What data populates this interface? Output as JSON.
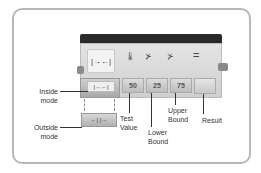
{
  "block": {
    "mode_icon": "|→←|",
    "icons": [
      "thermometer-icon",
      "lower-bound-icon",
      "upper-bound-icon",
      "equals-icon"
    ],
    "equals_symbol": "=",
    "inside_mode_glyph": "|→←|",
    "outside_mode_glyph": "←|   |→",
    "values": {
      "test_value": "50",
      "lower_bound": "25",
      "upper_bound": "75"
    }
  },
  "callouts": {
    "inside_mode": [
      "Inside",
      "mode"
    ],
    "outside_mode": [
      "Outside",
      "mode"
    ],
    "test_value": [
      "Test",
      "Value"
    ],
    "lower_bound": [
      "Lower",
      "Bound"
    ],
    "upper_bound": [
      "Upper",
      "Bound"
    ],
    "result": [
      "Result"
    ]
  }
}
